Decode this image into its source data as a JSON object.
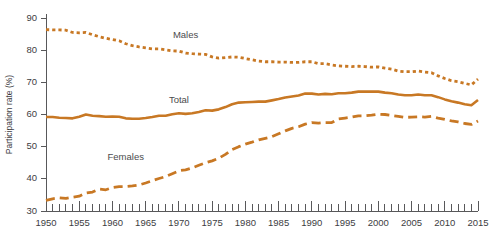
{
  "chart_data": {
    "type": "line",
    "title": "",
    "subtitle": "",
    "xlabel": "",
    "ylabel": "Participation rate (%)",
    "xlim": [
      1950,
      2015
    ],
    "ylim": [
      30,
      90
    ],
    "grid": false,
    "legend_position": "inline-annotations",
    "accent_color": "#c87824",
    "axis_color": "#58585a",
    "text_color": "#3d3d3f",
    "ytick_labels": [
      "30",
      "40",
      "50",
      "60",
      "70",
      "80",
      "90"
    ],
    "ytick_values": [
      30,
      40,
      50,
      60,
      70,
      80,
      90
    ],
    "xtick_labels": [
      "1950",
      "1955",
      "1960",
      "1965",
      "1970",
      "1975",
      "1980",
      "1985",
      "1990",
      "1995",
      "2000",
      "2005",
      "2010",
      "2015"
    ],
    "xtick_values": [
      1950,
      1955,
      1960,
      1965,
      1970,
      1975,
      1980,
      1985,
      1990,
      1995,
      2000,
      2005,
      2010,
      2015
    ],
    "minor_tick_interval": 1,
    "x": [
      1950,
      1951,
      1952,
      1953,
      1954,
      1955,
      1956,
      1957,
      1958,
      1959,
      1960,
      1961,
      1962,
      1963,
      1964,
      1965,
      1966,
      1967,
      1968,
      1969,
      1970,
      1971,
      1972,
      1973,
      1974,
      1975,
      1976,
      1977,
      1978,
      1979,
      1980,
      1981,
      1982,
      1983,
      1984,
      1985,
      1986,
      1987,
      1988,
      1989,
      1990,
      1991,
      1992,
      1993,
      1994,
      1995,
      1996,
      1997,
      1998,
      1999,
      2000,
      2001,
      2002,
      2003,
      2004,
      2005,
      2006,
      2007,
      2008,
      2009,
      2010,
      2011,
      2012,
      2013,
      2014,
      2015
    ],
    "series": [
      {
        "name": "Males",
        "label": "Males",
        "style": "dotted",
        "color": "#c87824",
        "label_x": 1971,
        "label_y": 84.5,
        "values": [
          86.4,
          86.3,
          86.3,
          86.2,
          85.5,
          85.4,
          85.5,
          84.8,
          84.2,
          83.7,
          83.3,
          82.9,
          82.0,
          81.4,
          81.0,
          80.7,
          80.4,
          80.4,
          80.1,
          79.8,
          79.7,
          79.1,
          78.9,
          78.8,
          78.7,
          77.9,
          77.5,
          77.7,
          77.9,
          77.8,
          77.4,
          77.0,
          76.6,
          76.4,
          76.4,
          76.3,
          76.3,
          76.2,
          76.2,
          76.4,
          76.4,
          75.8,
          75.8,
          75.4,
          75.1,
          75.0,
          74.9,
          75.0,
          74.9,
          74.7,
          74.8,
          74.4,
          74.1,
          73.5,
          73.3,
          73.3,
          73.5,
          73.2,
          73.0,
          72.0,
          71.2,
          70.5,
          70.2,
          69.7,
          69.2,
          71.0
        ]
      },
      {
        "name": "Total",
        "label": "Total",
        "style": "solid",
        "color": "#c87824",
        "label_x": 1970,
        "label_y": 64.2,
        "values": [
          59.2,
          59.2,
          59.0,
          58.9,
          58.8,
          59.3,
          60.0,
          59.6,
          59.5,
          59.3,
          59.4,
          59.3,
          58.8,
          58.7,
          58.7,
          58.9,
          59.2,
          59.6,
          59.6,
          60.1,
          60.4,
          60.2,
          60.4,
          60.8,
          61.3,
          61.2,
          61.6,
          62.3,
          63.2,
          63.7,
          63.8,
          63.9,
          64.0,
          64.0,
          64.4,
          64.8,
          65.3,
          65.6,
          65.9,
          66.5,
          66.5,
          66.2,
          66.4,
          66.3,
          66.6,
          66.6,
          66.8,
          67.1,
          67.1,
          67.1,
          67.1,
          66.8,
          66.6,
          66.2,
          66.0,
          66.0,
          66.2,
          66.0,
          66.0,
          65.4,
          64.7,
          64.1,
          63.7,
          63.2,
          62.9,
          64.5
        ]
      },
      {
        "name": "Females",
        "label": "Females",
        "style": "dashed",
        "color": "#c87824",
        "label_x": 1962,
        "label_y": 46.5,
        "values": [
          33.3,
          33.8,
          34.1,
          33.9,
          34.3,
          34.6,
          35.6,
          35.9,
          36.8,
          36.6,
          37.3,
          37.6,
          37.6,
          37.8,
          38.1,
          38.7,
          39.4,
          40.1,
          40.7,
          41.6,
          42.5,
          42.8,
          43.4,
          44.2,
          45.0,
          45.6,
          46.4,
          47.6,
          49.1,
          50.0,
          50.8,
          51.4,
          52.1,
          52.6,
          53.1,
          54.0,
          54.9,
          55.7,
          56.2,
          57.0,
          57.5,
          57.3,
          57.5,
          57.5,
          58.6,
          58.9,
          59.2,
          59.6,
          59.6,
          59.8,
          60.1,
          60.0,
          59.7,
          59.4,
          59.1,
          59.2,
          59.3,
          59.2,
          59.4,
          58.9,
          58.5,
          58.0,
          57.7,
          57.2,
          56.9,
          58.0
        ]
      }
    ]
  }
}
